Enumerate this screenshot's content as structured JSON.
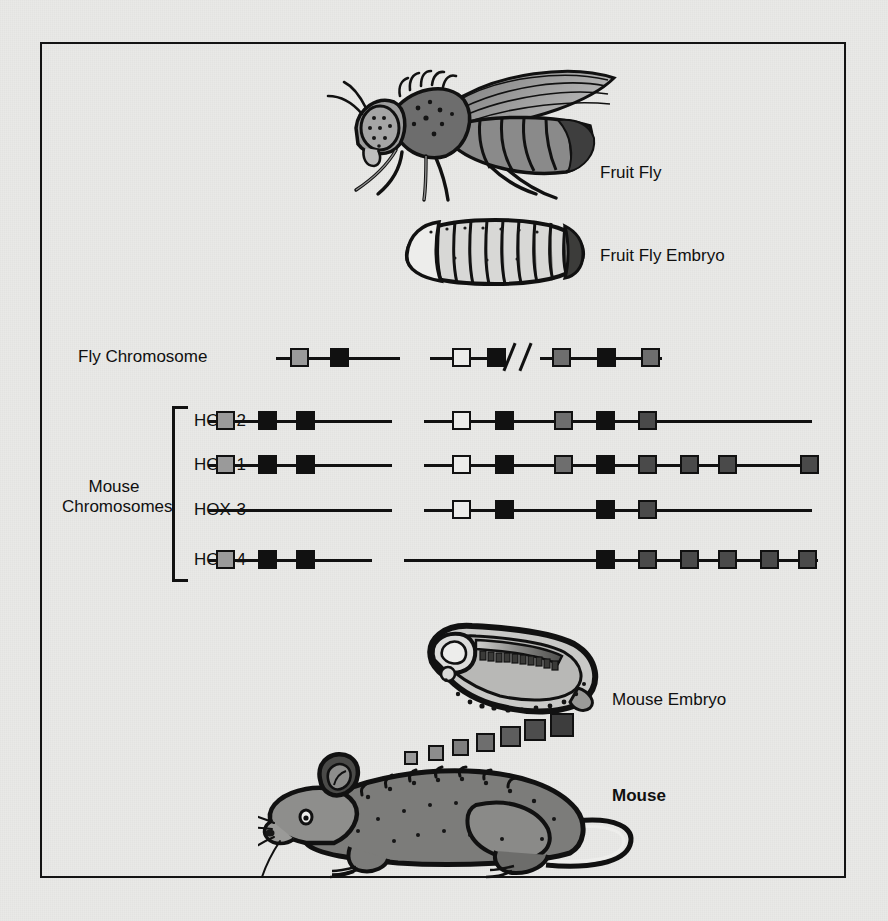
{
  "figure": {
    "background_color": "#e9e9e7",
    "frame_color": "#141414"
  },
  "labels": {
    "fruit_fly": "Fruit Fly",
    "fruit_fly_embryo": "Fruit Fly Embryo",
    "fly_chromosome": "Fly Chromosome",
    "mouse_chromosomes_line1": "Mouse",
    "mouse_chromosomes_line2": "Chromosomes",
    "mouse_embryo": "Mouse Embryo",
    "mouse": "Mouse"
  },
  "row_labels": {
    "hox2": "HOX-2",
    "hox1": "HOX-1",
    "hox3": "HOX-3",
    "hox4": "HOX-4"
  },
  "colors": {
    "black": "#111111",
    "white": "#ececea",
    "light_gray": "#9a9a9a",
    "mid_gray": "#6e6e6e",
    "dark_gray": "#4a4a4a"
  },
  "chart_data": {
    "type": "diagram",
    "legend_note": "Box shading key: white, black, light gray, mid gray, dark gray denote successive anterior-to-posterior Hox paralog groups.",
    "rows": [
      {
        "name": "Fly Chromosome",
        "label": "",
        "y": 358,
        "segments": [
          {
            "x1": 276,
            "x2": 400
          },
          {
            "x1": 430,
            "x2": 500
          },
          {
            "x1": 540,
            "x2": 662
          }
        ],
        "break_marks": [
          {
            "x": 508
          },
          {
            "x": 524
          }
        ],
        "genes": [
          {
            "x": 290,
            "color": "light_gray"
          },
          {
            "x": 330,
            "color": "black"
          },
          {
            "x": 452,
            "color": "white"
          },
          {
            "x": 487,
            "color": "black"
          },
          {
            "x": 552,
            "color": "mid_gray"
          },
          {
            "x": 597,
            "color": "black"
          },
          {
            "x": 641,
            "color": "mid_gray"
          }
        ]
      },
      {
        "name": "HOX-2",
        "label": "HOX-2",
        "y": 421,
        "segments": [
          {
            "x1": 208,
            "x2": 392
          },
          {
            "x1": 424,
            "x2": 812
          }
        ],
        "break_marks": [],
        "genes": [
          {
            "x": 216,
            "color": "light_gray"
          },
          {
            "x": 258,
            "color": "black"
          },
          {
            "x": 296,
            "color": "black"
          },
          {
            "x": 452,
            "color": "white"
          },
          {
            "x": 495,
            "color": "black"
          },
          {
            "x": 554,
            "color": "mid_gray"
          },
          {
            "x": 596,
            "color": "black"
          },
          {
            "x": 638,
            "color": "dark_gray"
          }
        ]
      },
      {
        "name": "HOX-1",
        "label": "HOX-1",
        "y": 465,
        "segments": [
          {
            "x1": 208,
            "x2": 392
          },
          {
            "x1": 424,
            "x2": 818
          }
        ],
        "break_marks": [],
        "genes": [
          {
            "x": 216,
            "color": "light_gray"
          },
          {
            "x": 258,
            "color": "black"
          },
          {
            "x": 296,
            "color": "black"
          },
          {
            "x": 452,
            "color": "white"
          },
          {
            "x": 495,
            "color": "black"
          },
          {
            "x": 554,
            "color": "mid_gray"
          },
          {
            "x": 596,
            "color": "black"
          },
          {
            "x": 638,
            "color": "dark_gray"
          },
          {
            "x": 680,
            "color": "dark_gray"
          },
          {
            "x": 718,
            "color": "dark_gray"
          },
          {
            "x": 800,
            "color": "dark_gray"
          }
        ]
      },
      {
        "name": "HOX-3",
        "label": "HOX-3",
        "y": 510,
        "segments": [
          {
            "x1": 208,
            "x2": 392
          },
          {
            "x1": 424,
            "x2": 812
          }
        ],
        "break_marks": [],
        "genes": [
          {
            "x": 452,
            "color": "white"
          },
          {
            "x": 495,
            "color": "black"
          },
          {
            "x": 596,
            "color": "black"
          },
          {
            "x": 638,
            "color": "dark_gray"
          }
        ]
      },
      {
        "name": "HOX-4",
        "label": "HOX-4",
        "y": 560,
        "segments": [
          {
            "x1": 208,
            "x2": 372
          },
          {
            "x1": 404,
            "x2": 818
          }
        ],
        "break_marks": [],
        "genes": [
          {
            "x": 216,
            "color": "light_gray"
          },
          {
            "x": 258,
            "color": "black"
          },
          {
            "x": 296,
            "color": "black"
          },
          {
            "x": 596,
            "color": "black"
          },
          {
            "x": 638,
            "color": "dark_gray"
          },
          {
            "x": 680,
            "color": "dark_gray"
          },
          {
            "x": 718,
            "color": "dark_gray"
          },
          {
            "x": 760,
            "color": "dark_gray"
          },
          {
            "x": 798,
            "color": "dark_gray"
          }
        ]
      }
    ],
    "mouse_back_squares": [
      {
        "x": 404,
        "y": 751,
        "size": 14,
        "color": "#9a9a9a"
      },
      {
        "x": 428,
        "y": 745,
        "size": 16,
        "color": "#8d8d8d"
      },
      {
        "x": 452,
        "y": 739,
        "size": 17,
        "color": "#7e7e7e"
      },
      {
        "x": 476,
        "y": 733,
        "size": 19,
        "color": "#6e6e6e"
      },
      {
        "x": 500,
        "y": 726,
        "size": 21,
        "color": "#5d5d5d"
      },
      {
        "x": 524,
        "y": 719,
        "size": 22,
        "color": "#4d4d4d"
      },
      {
        "x": 550,
        "y": 713,
        "size": 24,
        "color": "#3d3d3d"
      }
    ]
  }
}
